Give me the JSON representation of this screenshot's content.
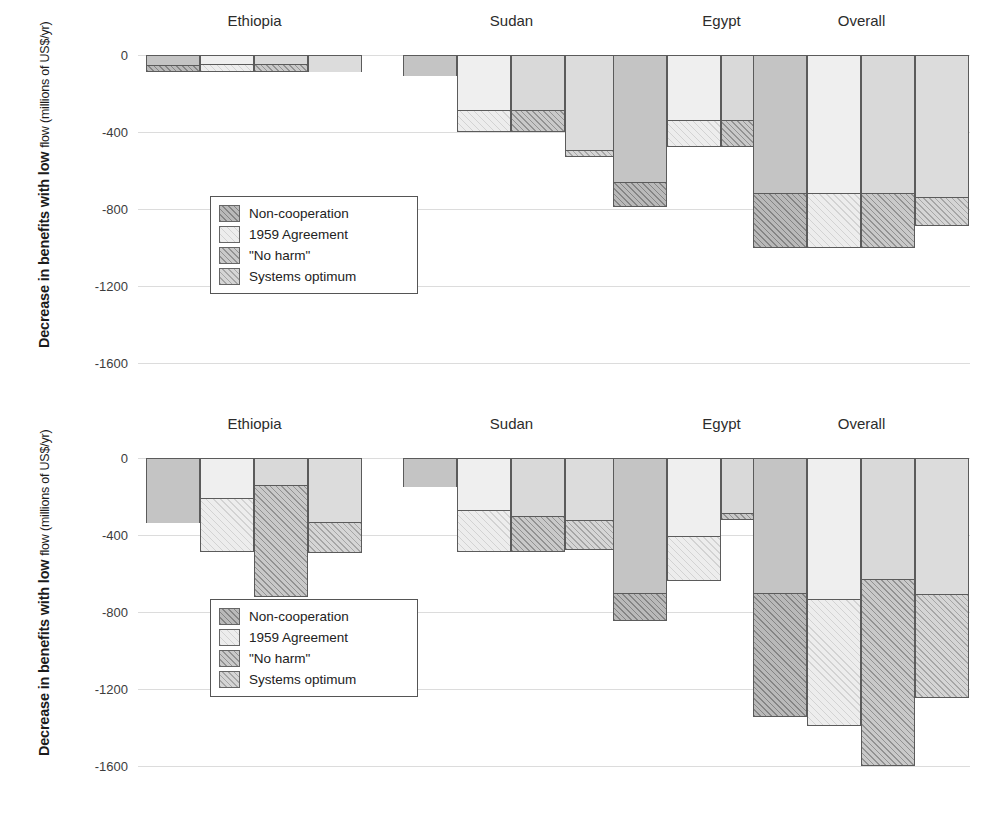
{
  "axis": {
    "title_main": "Decrease in benefits with low",
    "title_sub_line": "flow (millions of US$/yr)",
    "ticks": [
      "0",
      "-400",
      "-800",
      "-1200",
      "-1600"
    ],
    "tick_values": [
      0,
      -400,
      -800,
      -1200,
      -1600
    ],
    "ymin": -1600,
    "ymax": 0
  },
  "legend": {
    "items": [
      {
        "label": "Non-cooperation",
        "key": "noncoop"
      },
      {
        "label": "1959 Agreement",
        "key": "a1959"
      },
      {
        "label": "\"No harm\"",
        "key": "noharm"
      },
      {
        "label": "Systems optimum",
        "key": "sysopt"
      }
    ]
  },
  "groups": [
    "Ethiopia",
    "Sudan",
    "Egypt",
    "Overall"
  ],
  "chart_data": [
    {
      "id": "top",
      "type": "bar",
      "title": "",
      "xlabel": "",
      "ylabel": "Decrease in benefits with low flow (millions of US$/yr)",
      "ylim": [
        -1600,
        0
      ],
      "yticks": [
        0,
        -400,
        -800,
        -1200,
        -1600
      ],
      "grid": true,
      "stacked": true,
      "legend_position": "inside-lower-left",
      "categories": [
        "Ethiopia",
        "Sudan",
        "Egypt",
        "Overall"
      ],
      "series": [
        {
          "name": "Non-cooperation",
          "totals": [
            -88,
            -110,
            -790,
            -1005
          ],
          "upper_segment": [
            -52,
            -110,
            -660,
            -715
          ]
        },
        {
          "name": "1959 Agreement",
          "totals": [
            -88,
            -400,
            -480,
            -1005
          ],
          "upper_segment": [
            -46,
            -288,
            -340,
            -715
          ]
        },
        {
          "name": "\"No harm\"",
          "totals": [
            -88,
            -400,
            -480,
            -1005
          ],
          "upper_segment": [
            -46,
            -288,
            -340,
            -715
          ]
        },
        {
          "name": "Systems optimum",
          "totals": [
            -86,
            -530,
            -242,
            -890
          ],
          "upper_segment": [
            -86,
            -492,
            -215,
            -740
          ]
        }
      ]
    },
    {
      "id": "bottom",
      "type": "bar",
      "title": "",
      "xlabel": "",
      "ylabel": "Decrease in benefits with low flow (millions of US$/yr)",
      "ylim": [
        -1600,
        0
      ],
      "yticks": [
        0,
        -400,
        -800,
        -1200,
        -1600
      ],
      "grid": true,
      "stacked": true,
      "legend_position": "inside-lower-left",
      "categories": [
        "Ethiopia",
        "Sudan",
        "Egypt",
        "Overall"
      ],
      "series": [
        {
          "name": "Non-cooperation",
          "totals": [
            -340,
            -150,
            -845,
            -1345
          ],
          "upper_segment": [
            -340,
            -150,
            -700,
            -700
          ]
        },
        {
          "name": "1959 Agreement",
          "totals": [
            -490,
            -490,
            -640,
            -1390
          ],
          "upper_segment": [
            -208,
            -270,
            -405,
            -730
          ]
        },
        {
          "name": "\"No harm\"",
          "totals": [
            -720,
            -490,
            -320,
            -1600
          ],
          "upper_segment": [
            -140,
            -300,
            -285,
            -630
          ]
        },
        {
          "name": "Systems optimum",
          "totals": [
            -495,
            -480,
            -420,
            -1245
          ],
          "upper_segment": [
            -330,
            -320,
            -365,
            -705
          ]
        }
      ]
    }
  ]
}
